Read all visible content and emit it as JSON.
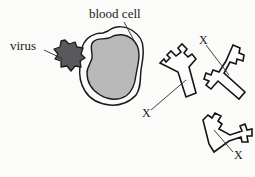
{
  "figure": {
    "type": "biology-diagram",
    "background_color": "#fbfbfa",
    "width": 255,
    "height": 177
  },
  "labels": {
    "virus": "virus",
    "blood_cell": "blood cell",
    "antibody_1": "X",
    "antibody_2": "X",
    "antibody_3": "X"
  },
  "shapes": {
    "virus": {
      "name": "virus-particle",
      "description": "spiky hexagonal particle",
      "fill_color": "#59595c",
      "stroke_color": "#1c1c1c"
    },
    "blood_cell": {
      "name": "blood-cell",
      "description": "irregular blob with double membrane outline",
      "membrane_color": "#ffffff",
      "cytoplasm_color": "#b9b9b9",
      "stroke_color": "#1c1c1c"
    },
    "antibodies": {
      "name": "antibody-y-shapes",
      "count": 3,
      "fill_color": "#fdfdfc",
      "stroke_color": "#141414"
    }
  }
}
